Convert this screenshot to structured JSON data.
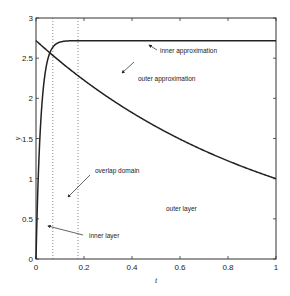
{
  "chart_data": {
    "type": "line",
    "title": "",
    "xlabel": "t",
    "ylabel": "y",
    "xlim": [
      0,
      1
    ],
    "ylim": [
      0,
      3
    ],
    "grid": false,
    "legend": null,
    "x_ticks": [
      "0",
      "0.2",
      "0.4",
      "0.6",
      "0.8",
      "1"
    ],
    "y_ticks": [
      "0",
      "0.5",
      "1",
      "1.5",
      "2",
      "2.5",
      "3"
    ],
    "series": [
      {
        "name": "inner approximation",
        "formula": "y = e(1 - exp(-t/0.02))",
        "x": [
          0,
          0.01,
          0.02,
          0.04,
          0.06,
          0.1,
          0.15,
          0.2,
          0.3,
          1.0
        ],
        "values": [
          0,
          1.07,
          1.72,
          2.35,
          2.58,
          2.7,
          2.72,
          2.72,
          2.72,
          2.72
        ]
      },
      {
        "name": "outer approximation",
        "formula": "y = exp(1 - t)",
        "x": [
          0,
          0.1,
          0.2,
          0.3,
          0.4,
          0.5,
          0.6,
          0.7,
          0.8,
          0.9,
          1.0
        ],
        "values": [
          2.72,
          2.46,
          2.23,
          2.01,
          1.82,
          1.65,
          1.49,
          1.35,
          1.22,
          1.11,
          1.0
        ]
      }
    ],
    "vertical_dotted_lines": [
      0.07,
      0.175
    ],
    "annotations": [
      {
        "text": "inner approximation",
        "x": 0.52,
        "y": 2.68
      },
      {
        "text": "outer approximation",
        "x": 0.44,
        "y": 2.38
      },
      {
        "text": "overlap domain",
        "x": 0.34,
        "y": 1.2
      },
      {
        "text": "inner layer",
        "x": 0.28,
        "y": 0.38
      },
      {
        "text": "outer layer",
        "x": 0.6,
        "y": 0.62
      }
    ]
  },
  "labels": {
    "xlabel": "t",
    "ylabel": "y",
    "ann_inner_approx": "inner approximation",
    "ann_outer_approx": "outer approximation",
    "ann_overlap": "overlap domain",
    "ann_inner_layer": "inner layer",
    "ann_outer_layer": "outer layer"
  }
}
